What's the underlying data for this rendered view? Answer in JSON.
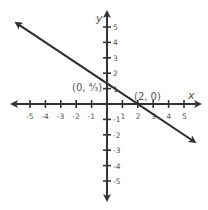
{
  "chart_data": {
    "type": "line",
    "title": "",
    "xlabel": "x",
    "ylabel": "y",
    "xlim": [
      -5,
      5
    ],
    "ylim": [
      -5,
      5
    ],
    "grid": false,
    "x_ticks": [
      -5,
      -4,
      -3,
      -2,
      -1,
      1,
      2,
      3,
      4,
      5
    ],
    "y_ticks": [
      5,
      4,
      3,
      2,
      1,
      -1,
      -2,
      -3,
      -4,
      -5
    ],
    "series": [
      {
        "name": "line",
        "equation": "y = -2/3 x + 4/3",
        "points": [
          {
            "x": 0,
            "y": 1.333,
            "label": "(0, 4/3)"
          },
          {
            "x": 2,
            "y": 0,
            "label": "(2, 0)"
          }
        ],
        "arrows": "both"
      }
    ],
    "annotations": [
      {
        "text": "(0, ⁴⁄₃)",
        "x": 0,
        "y": 1.333
      },
      {
        "text": "(2, 0)",
        "x": 2,
        "y": 0
      }
    ]
  },
  "labels": {
    "x_axis": "x",
    "y_axis": "y",
    "point_a": "(0, ⁴⁄₃)",
    "point_b": "(2, 0)"
  },
  "colors": {
    "axis": "#333333",
    "line": "#2b2b2b",
    "text": "#555555"
  }
}
